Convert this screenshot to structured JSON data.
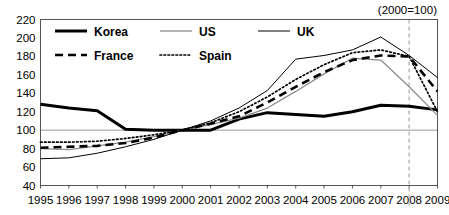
{
  "chart_data": {
    "type": "line",
    "title": "",
    "subtitle": "",
    "annotation": "(2000=100)",
    "xlabel": "",
    "ylabel": "",
    "x": [
      1995,
      1996,
      1997,
      1998,
      1999,
      2000,
      2001,
      2002,
      2003,
      2004,
      2005,
      2006,
      2007,
      2008,
      2009
    ],
    "categories": [
      "1995",
      "1996",
      "1997",
      "1998",
      "1999",
      "2000",
      "2001",
      "2002",
      "2003",
      "2004",
      "2005",
      "2006",
      "2007",
      "2008",
      "2009"
    ],
    "xlim": [
      1995,
      2009
    ],
    "ylim": [
      40,
      220
    ],
    "yticks": [
      40,
      60,
      80,
      100,
      120,
      140,
      160,
      180,
      200,
      220
    ],
    "ytick_labels": [
      "40",
      "60",
      "80",
      "100",
      "120",
      "140",
      "160",
      "180",
      "200",
      "220"
    ],
    "grid": "horizontal-baseline-only",
    "baseline_value": 100,
    "reference_line_x": 2008,
    "legend_position": "top-left-inside",
    "series": [
      {
        "name": "Korea",
        "style": "solid-thick-black",
        "color": "#000000",
        "values": [
          128,
          124,
          121,
          101,
          100,
          100,
          100,
          112,
          119,
          117,
          115,
          120,
          127,
          126,
          122
        ]
      },
      {
        "name": "US",
        "style": "solid-thin-gray",
        "color": "#8c8c8c",
        "values": [
          80,
          79,
          83,
          87,
          93,
          100,
          106,
          113,
          124,
          142,
          161,
          178,
          176,
          147,
          116
        ]
      },
      {
        "name": "UK",
        "style": "solid-thin-black",
        "color": "#000000",
        "values": [
          69,
          70,
          75,
          82,
          90,
          100,
          110,
          124,
          143,
          177,
          181,
          187,
          201,
          181,
          157
        ]
      },
      {
        "name": "France",
        "style": "dashed-thick-black",
        "color": "#000000",
        "values": [
          81,
          82,
          83,
          86,
          92,
          100,
          107,
          115,
          130,
          147,
          163,
          176,
          181,
          180,
          142
        ]
      },
      {
        "name": "Spain",
        "style": "dotted-black",
        "color": "#000000",
        "values": [
          87,
          87,
          88,
          91,
          95,
          100,
          108,
          120,
          136,
          155,
          171,
          184,
          187,
          180,
          120
        ]
      }
    ]
  },
  "legend": {
    "entries": [
      {
        "label": "Korea"
      },
      {
        "label": "US"
      },
      {
        "label": "UK"
      },
      {
        "label": "France"
      },
      {
        "label": "Spain"
      }
    ]
  },
  "colors": {
    "korea": "#000000",
    "us": "#8c8c8c",
    "uk": "#000000",
    "france": "#000000",
    "spain": "#000000",
    "frame": "#555555",
    "baseline": "#9a9a9a",
    "reference_line": "#b4b4b4",
    "background": "#ffffff"
  }
}
